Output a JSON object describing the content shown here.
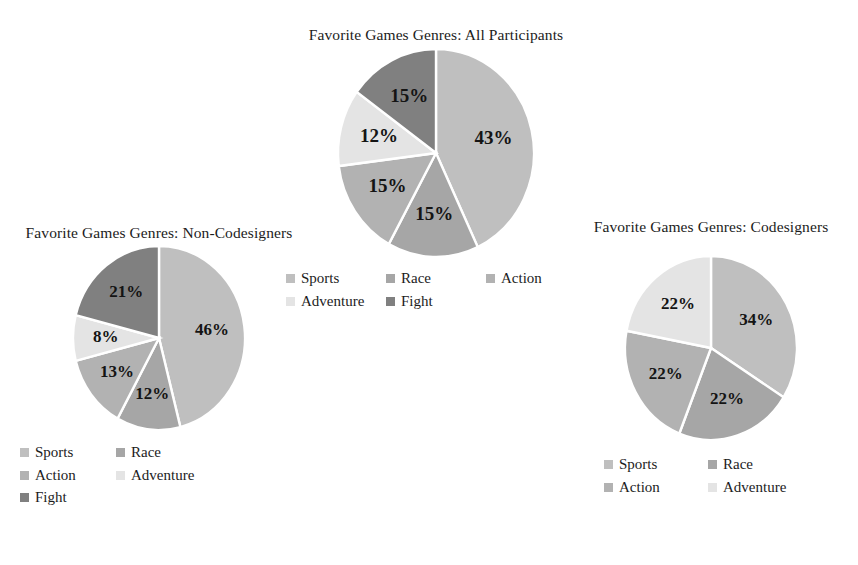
{
  "figure": {
    "background": "#ffffff",
    "label_suffix": "%"
  },
  "palette": {
    "Sports": "#bfbfbf",
    "Race": "#a6a6a6",
    "Action": "#b2b2b2",
    "Adventure": "#e4e4e4",
    "Fight": "#808080",
    "slice_border": "#ffffff",
    "label_color": "#141414",
    "title_color": "#1c1c1c"
  },
  "charts": [
    {
      "id": "all",
      "title": "Favorite Games Genres: All Participants",
      "legend_position": "bottom",
      "legend_columns": 3,
      "legend": [
        "Sports",
        "Race",
        "Action",
        "Adventure",
        "Fight"
      ],
      "labels": [
        "43%",
        "15%",
        "15%",
        "12%",
        "15%"
      ]
    },
    {
      "id": "non-codesigners",
      "title": "Favorite Games Genres: Non-Codesigners",
      "legend_position": "bottom",
      "legend_columns": 3,
      "legend": [
        "Sports",
        "Race",
        "Action",
        "Adventure",
        "Fight"
      ],
      "labels": [
        "46%",
        "12%",
        "13%",
        "8%",
        "21%"
      ]
    },
    {
      "id": "codesigners",
      "title": "Favorite Games Genres: Codesigners",
      "legend_position": "bottom",
      "legend_columns": 2,
      "legend": [
        "Sports",
        "Race",
        "Action",
        "Adventure"
      ],
      "labels": [
        "34%",
        "22%",
        "22%",
        "22%"
      ]
    }
  ],
  "chart_data": [
    {
      "type": "pie",
      "title": "Favorite Games Genres: All Participants",
      "categories": [
        "Sports",
        "Race",
        "Action",
        "Adventure",
        "Fight"
      ],
      "values": [
        43,
        15,
        15,
        12,
        15
      ],
      "data_labels": [
        "43%",
        "15%",
        "15%",
        "12%",
        "15%"
      ],
      "units": "percent",
      "legend": [
        "Sports",
        "Race",
        "Action",
        "Adventure",
        "Fight"
      ],
      "legend_position": "bottom",
      "start_angle_deg": 0,
      "direction": "clockwise",
      "colors": [
        "#bfbfbf",
        "#a6a6a6",
        "#b2b2b2",
        "#e4e4e4",
        "#808080"
      ]
    },
    {
      "type": "pie",
      "title": "Favorite Games Genres: Non-Codesigners",
      "categories": [
        "Sports",
        "Race",
        "Action",
        "Adventure",
        "Fight"
      ],
      "values": [
        46,
        12,
        13,
        8,
        21
      ],
      "data_labels": [
        "46%",
        "12%",
        "13%",
        "8%",
        "21%"
      ],
      "units": "percent",
      "legend": [
        "Sports",
        "Race",
        "Action",
        "Adventure",
        "Fight"
      ],
      "legend_position": "bottom",
      "start_angle_deg": 0,
      "direction": "clockwise",
      "colors": [
        "#bfbfbf",
        "#a6a6a6",
        "#b2b2b2",
        "#e4e4e4",
        "#808080"
      ]
    },
    {
      "type": "pie",
      "title": "Favorite Games Genres: Codesigners",
      "categories": [
        "Sports",
        "Race",
        "Action",
        "Adventure"
      ],
      "values": [
        34,
        22,
        22,
        22
      ],
      "data_labels": [
        "34%",
        "22%",
        "22%",
        "22%"
      ],
      "units": "percent",
      "legend": [
        "Sports",
        "Race",
        "Action",
        "Adventure"
      ],
      "legend_position": "bottom",
      "start_angle_deg": 0,
      "direction": "clockwise",
      "colors": [
        "#bfbfbf",
        "#a6a6a6",
        "#b2b2b2",
        "#e4e4e4"
      ]
    }
  ]
}
